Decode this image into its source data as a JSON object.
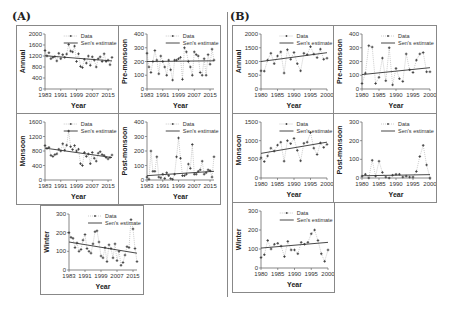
{
  "labels": {
    "panel_a": "(A)",
    "panel_b": "(B)"
  },
  "legend": {
    "data": "Data",
    "sen": "Sen's estimate"
  },
  "xlabel": "Year",
  "chart_data": [
    {
      "id": "A-annual",
      "panel": "A",
      "type": "line",
      "title": "",
      "xlabel": "Year",
      "ylabel": "Annual",
      "xlim": [
        1983,
        2017
      ],
      "ylim": [
        0,
        2000
      ],
      "yticks": [
        0,
        400,
        800,
        1200,
        1600,
        2000
      ],
      "xticks": [
        1983,
        1991,
        1999,
        2007,
        2015
      ],
      "x": [
        1983,
        1984,
        1985,
        1986,
        1987,
        1988,
        1989,
        1990,
        1991,
        1992,
        1993,
        1994,
        1995,
        1996,
        1997,
        1998,
        1999,
        2000,
        2001,
        2002,
        2003,
        2004,
        2005,
        2006,
        2007,
        2008,
        2009,
        2010,
        2011,
        2012,
        2013,
        2014,
        2015,
        2016,
        2017
      ],
      "values": [
        1400,
        1200,
        1320,
        1100,
        1150,
        1180,
        1020,
        1300,
        1100,
        1250,
        1150,
        1270,
        1620,
        1380,
        1350,
        1560,
        1000,
        1280,
        820,
        780,
        1080,
        940,
        1200,
        860,
        1170,
        1050,
        800,
        1100,
        1170,
        1000,
        1280,
        1000,
        1050,
        880,
        1150
      ],
      "trend": [
        1210,
        1020
      ]
    },
    {
      "id": "A-premonsoon",
      "panel": "A",
      "type": "line",
      "ylabel": "Pre-monsoon",
      "xlim": [
        1983,
        2017
      ],
      "ylim": [
        0,
        400
      ],
      "yticks": [
        0,
        100,
        200,
        300,
        400
      ],
      "xticks": [
        1983,
        1991,
        1999,
        2007,
        2015
      ],
      "x": [
        1983,
        1984,
        1985,
        1986,
        1987,
        1988,
        1989,
        1990,
        1991,
        1992,
        1993,
        1994,
        1995,
        1996,
        1997,
        1998,
        1999,
        2000,
        2001,
        2002,
        2003,
        2004,
        2005,
        2006,
        2007,
        2008,
        2009,
        2010,
        2011,
        2012,
        2013,
        2014,
        2015,
        2016,
        2017
      ],
      "values": [
        260,
        160,
        120,
        200,
        280,
        210,
        110,
        240,
        200,
        160,
        100,
        210,
        140,
        65,
        210,
        210,
        220,
        230,
        70,
        300,
        270,
        200,
        160,
        100,
        270,
        250,
        240,
        120,
        100,
        220,
        100,
        250,
        180,
        290,
        210
      ],
      "trend": [
        200,
        205
      ]
    },
    {
      "id": "A-monsoon",
      "panel": "A",
      "type": "line",
      "ylabel": "Monsoon",
      "xlim": [
        1983,
        2017
      ],
      "ylim": [
        0,
        1600
      ],
      "yticks": [
        0,
        400,
        800,
        1200,
        1600
      ],
      "xticks": [
        1983,
        1991,
        1999,
        2007,
        2015
      ],
      "x": [
        1983,
        1984,
        1985,
        1986,
        1987,
        1988,
        1989,
        1990,
        1991,
        1992,
        1993,
        1994,
        1995,
        1996,
        1997,
        1998,
        1999,
        2000,
        2001,
        2002,
        2003,
        2004,
        2005,
        2006,
        2007,
        2008,
        2009,
        2010,
        2011,
        2012,
        2013,
        2014,
        2015,
        2016,
        2017
      ],
      "values": [
        950,
        870,
        900,
        680,
        650,
        700,
        720,
        850,
        800,
        1000,
        820,
        960,
        1350,
        920,
        840,
        950,
        800,
        850,
        450,
        400,
        760,
        650,
        720,
        450,
        760,
        600,
        520,
        740,
        780,
        700,
        680,
        620,
        580,
        620,
        690
      ],
      "trend": [
        880,
        620
      ]
    },
    {
      "id": "A-postmonsoon",
      "panel": "A",
      "type": "line",
      "ylabel": "Post-monsoon",
      "xlim": [
        1983,
        2017
      ],
      "ylim": [
        0,
        400
      ],
      "yticks": [
        0,
        100,
        200,
        300,
        400
      ],
      "xticks": [
        1983,
        1991,
        1999,
        2007,
        2015
      ],
      "x": [
        1983,
        1984,
        1985,
        1986,
        1987,
        1988,
        1989,
        1990,
        1991,
        1992,
        1993,
        1994,
        1995,
        1996,
        1997,
        1998,
        1999,
        2000,
        2001,
        2002,
        2003,
        2004,
        2005,
        2006,
        2007,
        2008,
        2009,
        2010,
        2011,
        2012,
        2013,
        2014,
        2015,
        2016,
        2017
      ],
      "values": [
        20,
        5,
        200,
        60,
        60,
        160,
        20,
        15,
        40,
        10,
        50,
        30,
        10,
        5,
        40,
        160,
        290,
        150,
        30,
        30,
        40,
        110,
        80,
        245,
        40,
        40,
        60,
        70,
        130,
        40,
        50,
        70,
        65,
        20,
        160
      ],
      "trend": [
        30,
        60
      ]
    },
    {
      "id": "A-winter",
      "panel": "A",
      "type": "line",
      "ylabel": "Winter",
      "xlim": [
        1983,
        2017
      ],
      "ylim": [
        0,
        300
      ],
      "yticks": [
        0,
        100,
        200,
        300
      ],
      "xticks": [
        1983,
        1991,
        1999,
        2007,
        2015
      ],
      "x": [
        1983,
        1984,
        1985,
        1986,
        1987,
        1988,
        1989,
        1990,
        1991,
        1992,
        1993,
        1994,
        1995,
        1996,
        1997,
        1998,
        1999,
        2000,
        2001,
        2002,
        2003,
        2004,
        2005,
        2006,
        2007,
        2008,
        2009,
        2010,
        2011,
        2012,
        2013,
        2014,
        2015,
        2016,
        2017
      ],
      "values": [
        200,
        175,
        170,
        120,
        145,
        100,
        110,
        160,
        190,
        115,
        100,
        90,
        140,
        205,
        210,
        150,
        75,
        65,
        120,
        45,
        135,
        115,
        65,
        140,
        50,
        100,
        25,
        40,
        80,
        125,
        120,
        270,
        220,
        115,
        45
      ],
      "trend": [
        150,
        90
      ]
    },
    {
      "id": "B-annual",
      "panel": "B",
      "type": "line",
      "ylabel": "Annual",
      "xlim": [
        1980,
        2000
      ],
      "ylim": [
        0,
        2000
      ],
      "yticks": [
        0,
        500,
        1000,
        1500,
        2000
      ],
      "xticks": [
        1980,
        1985,
        1990,
        1995,
        2000
      ],
      "x": [
        1980,
        1981,
        1982,
        1983,
        1984,
        1985,
        1986,
        1987,
        1988,
        1989,
        1990,
        1991,
        1992,
        1993,
        1994,
        1995,
        1996,
        1997,
        1998,
        1999,
        2000
      ],
      "values": [
        660,
        650,
        1050,
        1300,
        920,
        1200,
        1350,
        580,
        1430,
        1080,
        1330,
        920,
        660,
        1300,
        1250,
        1540,
        1270,
        1140,
        1450,
        1080,
        1120
      ],
      "trend": [
        1000,
        1320
      ]
    },
    {
      "id": "B-premonsoon",
      "panel": "B",
      "type": "line",
      "ylabel": "Pre-monsoon",
      "xlim": [
        1980,
        2000
      ],
      "ylim": [
        0,
        400
      ],
      "yticks": [
        0,
        100,
        200,
        300,
        400
      ],
      "xticks": [
        1980,
        1985,
        1990,
        1995,
        2000
      ],
      "x": [
        1980,
        1981,
        1982,
        1983,
        1984,
        1985,
        1986,
        1987,
        1988,
        1989,
        1990,
        1991,
        1992,
        1993,
        1994,
        1995,
        1996,
        1997,
        1998,
        1999,
        2000
      ],
      "values": [
        40,
        115,
        315,
        305,
        40,
        85,
        225,
        60,
        300,
        30,
        150,
        75,
        55,
        255,
        140,
        120,
        210,
        255,
        265,
        125,
        125
      ],
      "trend": [
        105,
        155
      ]
    },
    {
      "id": "B-monsoon",
      "panel": "B",
      "type": "line",
      "ylabel": "Monsoon",
      "xlim": [
        1980,
        2000
      ],
      "ylim": [
        0,
        1500
      ],
      "yticks": [
        0,
        500,
        1000,
        1500
      ],
      "xticks": [
        1980,
        1985,
        1990,
        1995,
        2000
      ],
      "x": [
        1980,
        1981,
        1982,
        1983,
        1984,
        1985,
        1986,
        1987,
        1988,
        1989,
        1990,
        1991,
        1992,
        1993,
        1994,
        1995,
        1996,
        1997,
        1998,
        1999,
        2000
      ],
      "values": [
        540,
        440,
        590,
        800,
        720,
        880,
        960,
        450,
        1000,
        920,
        1060,
        740,
        460,
        930,
        960,
        1220,
        800,
        630,
        940,
        820,
        900
      ],
      "trend": [
        660,
        960
      ]
    },
    {
      "id": "B-postmonsoon",
      "panel": "B",
      "type": "line",
      "ylabel": "Post-monsoon",
      "xlim": [
        1980,
        2000
      ],
      "ylim": [
        0,
        300
      ],
      "yticks": [
        0,
        100,
        200,
        300
      ],
      "xticks": [
        1980,
        1985,
        1990,
        1995,
        2000
      ],
      "x": [
        1980,
        1981,
        1982,
        1983,
        1984,
        1985,
        1986,
        1987,
        1988,
        1989,
        1990,
        1991,
        1992,
        1993,
        1994,
        1995,
        1996,
        1997,
        1998,
        1999,
        2000
      ],
      "values": [
        10,
        20,
        0,
        95,
        10,
        90,
        30,
        5,
        0,
        15,
        20,
        20,
        5,
        10,
        5,
        5,
        35,
        115,
        175,
        70,
        0
      ],
      "trend": [
        12,
        18
      ]
    },
    {
      "id": "B-winter",
      "panel": "B",
      "type": "line",
      "ylabel": "Winter",
      "xlim": [
        1980,
        2000
      ],
      "ylim": [
        0,
        300
      ],
      "yticks": [
        0,
        100,
        200,
        300
      ],
      "xticks": [
        1980,
        1985,
        1990,
        1995,
        2000
      ],
      "x": [
        1980,
        1981,
        1982,
        1983,
        1984,
        1985,
        1986,
        1987,
        1988,
        1989,
        1990,
        1991,
        1992,
        1993,
        1994,
        1995,
        1996,
        1997,
        1998,
        1999,
        2000
      ],
      "values": [
        55,
        70,
        145,
        100,
        125,
        130,
        115,
        60,
        140,
        95,
        95,
        75,
        135,
        125,
        135,
        180,
        200,
        145,
        75,
        35,
        95
      ],
      "trend": [
        105,
        135
      ]
    }
  ]
}
